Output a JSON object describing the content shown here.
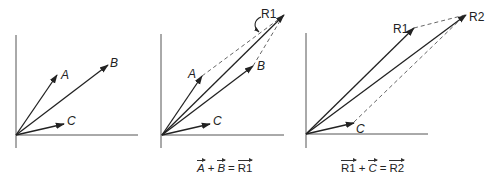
{
  "figure": {
    "panels": [
      {
        "id": "panel-1",
        "vectors": [
          {
            "name": "A",
            "label": "A",
            "italic": true
          },
          {
            "name": "B",
            "label": "B",
            "italic": true
          },
          {
            "name": "C",
            "label": "C",
            "italic": true
          }
        ]
      },
      {
        "id": "panel-2",
        "vectors": [
          {
            "name": "A",
            "label": "A",
            "italic": true
          },
          {
            "name": "B",
            "label": "B",
            "italic": true
          },
          {
            "name": "C",
            "label": "C",
            "italic": true
          },
          {
            "name": "R1",
            "label": "R1",
            "italic": false
          }
        ],
        "caption": {
          "term1": "A",
          "plus": "+",
          "term2": "B",
          "equals": "=",
          "result": "R1"
        }
      },
      {
        "id": "panel-3",
        "vectors": [
          {
            "name": "R1",
            "label": "R1",
            "italic": false
          },
          {
            "name": "C",
            "label": "C",
            "italic": true
          },
          {
            "name": "R2",
            "label": "R2",
            "italic": false
          }
        ],
        "caption": {
          "term1": "R1",
          "plus": "+",
          "term2": "C",
          "equals": "=",
          "result": "R2"
        }
      }
    ],
    "colors": {
      "vector": "#222222",
      "axis": "#555555",
      "dashed": "#555555"
    }
  }
}
